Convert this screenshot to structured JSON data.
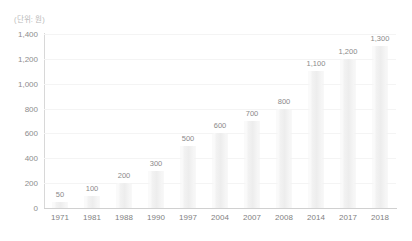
{
  "unit_label": "(단위: 원)",
  "colors": {
    "background": "#ffffff",
    "bar": "#f0f0f0",
    "gridline": "#f4f4f4",
    "axis": "#d4d4d4",
    "tick_text": "#8a8a8a",
    "unit_text": "#b9b9b9"
  },
  "chart_data": {
    "type": "bar",
    "title": "",
    "subtitle": "",
    "xlabel": "",
    "ylabel": "",
    "unit": "(단위: 원)",
    "categories": [
      "1971",
      "1981",
      "1988",
      "1990",
      "1997",
      "2004",
      "2007",
      "2008",
      "2014",
      "2017",
      "2018"
    ],
    "values": [
      50,
      100,
      200,
      300,
      500,
      600,
      700,
      800,
      1100,
      1200,
      1300
    ],
    "value_labels": [
      "50",
      "100",
      "200",
      "300",
      "500",
      "600",
      "700",
      "800",
      "1,100",
      "1,200",
      "1,300"
    ],
    "ylim": [
      0,
      1400
    ],
    "ytick_values": [
      0,
      200,
      400,
      600,
      800,
      1000,
      1200,
      1400
    ],
    "ytick_labels": [
      "0",
      "200",
      "400",
      "600",
      "800",
      "1,000",
      "1,200",
      "1,400"
    ],
    "grid": true,
    "grid_axis": "y",
    "legend": false,
    "legend_position": "none",
    "data_labels": true
  }
}
